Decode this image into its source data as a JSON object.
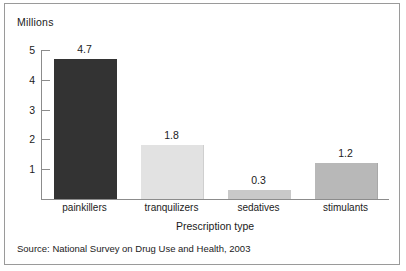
{
  "figure": {
    "unit_label": "Millions",
    "source_note": "Source: National Survey on Drug Use and Health, 2003",
    "frame_color": "#9a9a9a",
    "axis_color": "#8c8c8c",
    "background": "#ffffff"
  },
  "chart_data": {
    "type": "bar",
    "title": "",
    "subtitle": "",
    "xlabel": "Prescription type",
    "ylabel": "Millions",
    "categories": [
      "painkillers",
      "tranquilizers",
      "sedatives",
      "stimulants"
    ],
    "values": [
      4.7,
      1.8,
      0.3,
      1.2
    ],
    "value_labels": [
      "4.7",
      "1.8",
      "0.3",
      "1.2"
    ],
    "bar_colors": [
      "#333333",
      "#e2e2e2",
      "#c9c9c9",
      "#b8b8b8"
    ],
    "bar_border_colors": [
      "#333333",
      "#cfcfcf",
      "#c9c9c9",
      "#a8a8a8"
    ],
    "ylim": [
      0,
      5.2
    ],
    "yticks": [
      1,
      2,
      3,
      4,
      5
    ],
    "ytick_labels": [
      "1",
      "2",
      "3",
      "4",
      "5"
    ],
    "grid": false,
    "legend": null,
    "annotations": [
      "Source: National Survey on Drug Use and Health, 2003"
    ]
  }
}
